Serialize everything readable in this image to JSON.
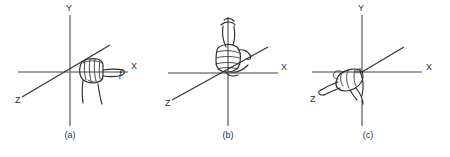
{
  "figure": {
    "background_color": "#ffffff",
    "axis_color": "#808080",
    "ink_color": "#2b2b2b",
    "panel_count": 3
  },
  "panels": [
    {
      "id": "a",
      "caption": "(a)",
      "axes": [
        {
          "name": "x-axis",
          "label": "X"
        },
        {
          "name": "y-axis",
          "label": "Y"
        },
        {
          "name": "z-axis",
          "label": "Z"
        }
      ],
      "labels": {
        "x": "X",
        "y": "Y",
        "z": "Z",
        "force": "f"
      },
      "hand": {
        "name": "fist-pointing-right",
        "description": "closed fist with index finger extended along the positive X axis"
      }
    },
    {
      "id": "b",
      "caption": "(b)",
      "axes": [
        {
          "name": "x-axis",
          "label": "X"
        },
        {
          "name": "y-axis",
          "label": ""
        },
        {
          "name": "z-axis",
          "label": "Z"
        }
      ],
      "labels": {
        "x": "X",
        "y": "",
        "z": "Z",
        "force": ""
      },
      "hand": {
        "name": "fist-thumb-up",
        "description": "closed fist with thumb extended upward along the positive Y axis"
      }
    },
    {
      "id": "c",
      "caption": "(c)",
      "axes": [
        {
          "name": "x-axis",
          "label": "X"
        },
        {
          "name": "y-axis",
          "label": "Y"
        },
        {
          "name": "z-axis",
          "label": "Z"
        }
      ],
      "labels": {
        "x": "X",
        "y": "Y",
        "z": "Z",
        "force": ""
      },
      "hand": {
        "name": "fist-pointing-lower-left",
        "description": "closed fist with index finger extended toward the Z axis at lower left"
      }
    }
  ]
}
